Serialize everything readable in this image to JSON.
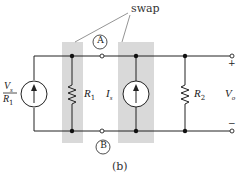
{
  "figure": {
    "caption": "(b)",
    "annotation": "swap",
    "colors": {
      "wire": "#222222",
      "shade": "#d9d9d9",
      "background": "#ffffff"
    },
    "sources": [
      {
        "id": "left-source",
        "label_num": "V",
        "label_num_sub": "s",
        "label_den": "R",
        "label_den_sub": "1",
        "type": "current-source-up"
      },
      {
        "id": "is-source",
        "label": "I",
        "label_sub": "s",
        "type": "current-source-up"
      }
    ],
    "resistors": [
      {
        "id": "r1",
        "label": "R",
        "label_sub": "1"
      },
      {
        "id": "r2",
        "label": "R",
        "label_sub": "2"
      }
    ],
    "terminals": {
      "a_label": "A",
      "b_label": "B",
      "plus": "+",
      "minus": "−"
    },
    "output": {
      "label": "V",
      "label_sub": "o"
    }
  }
}
